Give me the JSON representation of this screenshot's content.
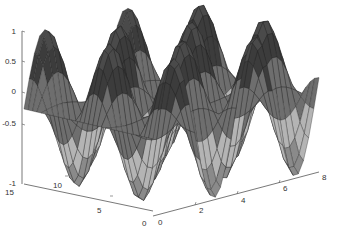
{
  "chart_data": {
    "type": "surface",
    "title": "",
    "xlabel": "",
    "ylabel": "",
    "zlabel": "",
    "function_hint": "z = sin(x*pi/...)*cos(y*...) style oscillating surface",
    "x_range": [
      0,
      8
    ],
    "y_range": [
      0,
      15
    ],
    "z_range": [
      -1,
      1
    ],
    "x_ticks": [
      "0",
      "2",
      "4",
      "6",
      "8"
    ],
    "y_ticks": [
      "0",
      "5",
      "10",
      "15"
    ],
    "z_ticks": [
      "-1",
      "-0.5",
      "0",
      "0.5",
      "1"
    ],
    "colormap": "gray",
    "grid": false,
    "view": "3d-perspective"
  },
  "axes": {
    "z_tick_labels": [
      "1",
      "0.5",
      "0",
      "-0.5",
      "-1"
    ],
    "y_tick_labels": [
      "15",
      "10",
      "5",
      "0"
    ],
    "x_tick_labels": [
      "0",
      "2",
      "4",
      "6",
      "8"
    ]
  },
  "colors": {
    "dark": "#3c3c3c",
    "mid": "#6e6e6e",
    "light": "#b4b4b4",
    "edge": "#222222",
    "axis": "#555555"
  }
}
